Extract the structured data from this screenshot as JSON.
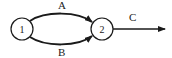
{
  "diagram": {
    "type": "directed-graph",
    "nodes": [
      {
        "id": "1",
        "label": "1",
        "cx": 22,
        "cy": 29,
        "r": 11
      },
      {
        "id": "2",
        "label": "2",
        "cx": 102,
        "cy": 29,
        "r": 11
      }
    ],
    "edges": [
      {
        "id": "A",
        "label": "A",
        "from": "1",
        "to": "2",
        "shape": "arc-top"
      },
      {
        "id": "B",
        "label": "B",
        "from": "1",
        "to": "2",
        "shape": "arc-bottom"
      },
      {
        "id": "C",
        "label": "C",
        "from": "2",
        "to": "out",
        "shape": "straight"
      }
    ],
    "colors": {
      "stroke": "#1a1a1a",
      "background": "#ffffff"
    }
  }
}
